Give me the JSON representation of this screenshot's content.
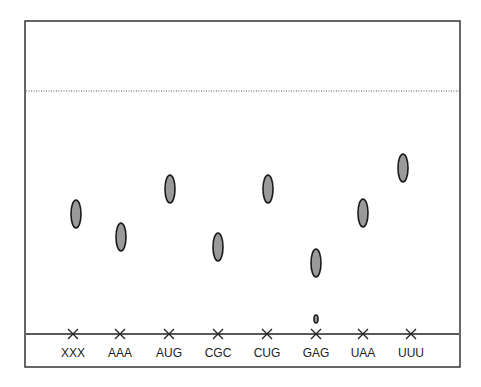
{
  "diagram": {
    "type": "chromatogram",
    "frame": {
      "x": 25,
      "y": 21,
      "width": 435,
      "height": 346
    },
    "solvent_front_y": 91,
    "origin_line_y": 334,
    "colors": {
      "spot_fill": "#9a9a9a",
      "spot_stroke": "#1a1a1a",
      "frame": "#333333"
    },
    "lanes": [
      {
        "label": "XXX",
        "x": 73,
        "spots": [
          {
            "cx": 76,
            "cy": 214,
            "rx": 5,
            "ry": 14
          }
        ]
      },
      {
        "label": "AAA",
        "x": 120,
        "spots": [
          {
            "cx": 121,
            "cy": 237,
            "rx": 5,
            "ry": 14
          }
        ]
      },
      {
        "label": "AUG",
        "x": 169,
        "spots": [
          {
            "cx": 170,
            "cy": 189,
            "rx": 5,
            "ry": 14
          }
        ]
      },
      {
        "label": "CGC",
        "x": 218,
        "spots": [
          {
            "cx": 218,
            "cy": 247,
            "rx": 5,
            "ry": 14
          }
        ]
      },
      {
        "label": "CUG",
        "x": 267,
        "spots": [
          {
            "cx": 268,
            "cy": 189,
            "rx": 5,
            "ry": 14
          }
        ]
      },
      {
        "label": "GAG",
        "x": 316,
        "spots": [
          {
            "cx": 316,
            "cy": 263,
            "rx": 5,
            "ry": 14
          },
          {
            "cx": 316,
            "cy": 319,
            "rx": 2,
            "ry": 4
          }
        ]
      },
      {
        "label": "UAA",
        "x": 363,
        "spots": [
          {
            "cx": 363,
            "cy": 213,
            "rx": 5,
            "ry": 14
          }
        ]
      },
      {
        "label": "UUU",
        "x": 411,
        "spots": [
          {
            "cx": 403,
            "cy": 168,
            "rx": 5,
            "ry": 14
          }
        ]
      }
    ]
  }
}
